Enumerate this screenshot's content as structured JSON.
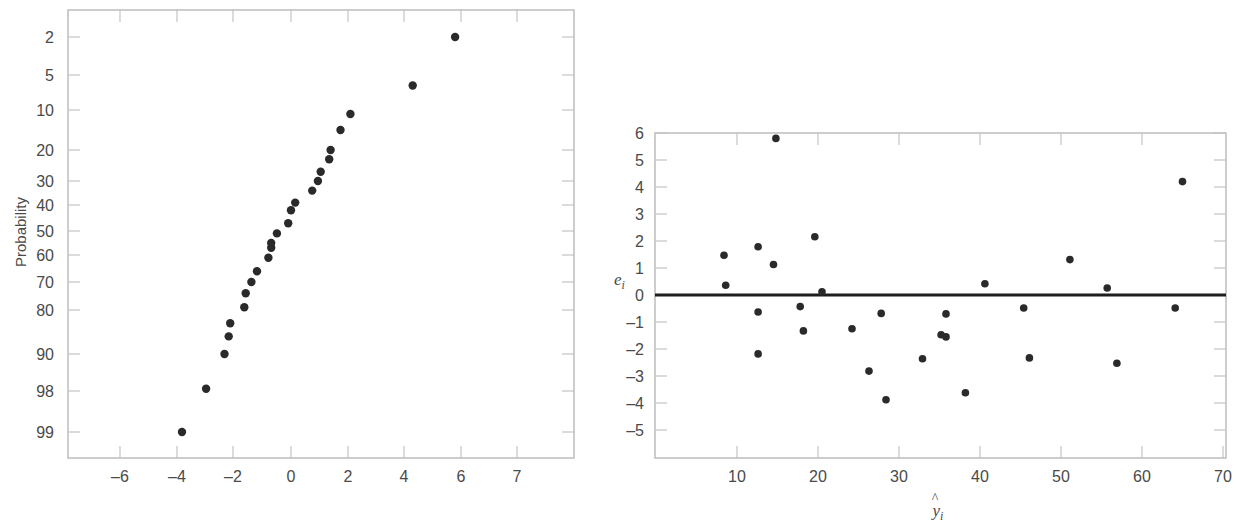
{
  "chart_data": [
    {
      "type": "scatter",
      "title": "",
      "subtitle": "Normal probability plot of residuals",
      "xlabel": "",
      "ylabel": "Probability",
      "x_ticks": [
        -6,
        -4,
        -2,
        0,
        2,
        4,
        6,
        7
      ],
      "y_ticks": [
        2,
        5,
        10,
        20,
        30,
        40,
        50,
        60,
        70,
        80,
        90,
        98,
        99
      ],
      "xlim": [
        -7.8,
        10
      ],
      "grid": false,
      "legend": null,
      "points": [
        {
          "x": 5.8,
          "y": 2
        },
        {
          "x": 4.3,
          "y": 6.5
        },
        {
          "x": 2.1,
          "y": 11
        },
        {
          "x": 1.75,
          "y": 15
        },
        {
          "x": 1.4,
          "y": 20
        },
        {
          "x": 1.35,
          "y": 23
        },
        {
          "x": 1.05,
          "y": 27
        },
        {
          "x": 0.95,
          "y": 30
        },
        {
          "x": 0.75,
          "y": 34
        },
        {
          "x": 0.15,
          "y": 39
        },
        {
          "x": 0.0,
          "y": 42
        },
        {
          "x": -0.1,
          "y": 47
        },
        {
          "x": -0.5,
          "y": 51
        },
        {
          "x": -0.7,
          "y": 55
        },
        {
          "x": -0.7,
          "y": 57
        },
        {
          "x": -0.8,
          "y": 61
        },
        {
          "x": -1.2,
          "y": 66
        },
        {
          "x": -1.4,
          "y": 70
        },
        {
          "x": -1.6,
          "y": 74
        },
        {
          "x": -1.65,
          "y": 79
        },
        {
          "x": -2.15,
          "y": 83
        },
        {
          "x": -2.2,
          "y": 86
        },
        {
          "x": -2.35,
          "y": 90
        },
        {
          "x": -3.0,
          "y": 97.5
        },
        {
          "x": -3.85,
          "y": 99
        }
      ]
    },
    {
      "type": "scatter",
      "title": "",
      "subtitle": "Residuals versus fitted values",
      "xlabel": "ŷᵢ",
      "ylabel": "eᵢ",
      "x_ticks": [
        10,
        20,
        30,
        40,
        50,
        60,
        70
      ],
      "y_ticks": [
        6,
        5,
        4,
        3,
        2,
        1,
        0,
        -1,
        -2,
        -3,
        -4,
        -5
      ],
      "xlim": [
        0,
        70
      ],
      "ylim": [
        -6,
        6
      ],
      "grid": false,
      "legend": null,
      "reference_line": {
        "y": 0
      },
      "points": [
        {
          "x": 8.4,
          "y": 1.47
        },
        {
          "x": 8.6,
          "y": 0.36
        },
        {
          "x": 12.6,
          "y": 1.79
        },
        {
          "x": 12.6,
          "y": -0.63
        },
        {
          "x": 12.6,
          "y": -2.18
        },
        {
          "x": 14.5,
          "y": 1.13
        },
        {
          "x": 14.8,
          "y": 5.8
        },
        {
          "x": 17.8,
          "y": -0.43
        },
        {
          "x": 18.2,
          "y": -1.33
        },
        {
          "x": 19.6,
          "y": 2.16
        },
        {
          "x": 20.5,
          "y": 0.12
        },
        {
          "x": 24.2,
          "y": -1.25
        },
        {
          "x": 26.3,
          "y": -2.82
        },
        {
          "x": 27.8,
          "y": -0.68
        },
        {
          "x": 28.4,
          "y": -3.88
        },
        {
          "x": 32.9,
          "y": -2.36
        },
        {
          "x": 35.2,
          "y": -1.47
        },
        {
          "x": 35.8,
          "y": -1.55
        },
        {
          "x": 35.8,
          "y": -0.7
        },
        {
          "x": 38.2,
          "y": -3.62
        },
        {
          "x": 40.6,
          "y": 0.42
        },
        {
          "x": 45.4,
          "y": -0.48
        },
        {
          "x": 46.1,
          "y": -2.33
        },
        {
          "x": 51.1,
          "y": 1.31
        },
        {
          "x": 55.7,
          "y": 0.26
        },
        {
          "x": 56.9,
          "y": -2.53
        },
        {
          "x": 64.1,
          "y": -0.48
        },
        {
          "x": 65.0,
          "y": 4.2
        }
      ]
    }
  ]
}
